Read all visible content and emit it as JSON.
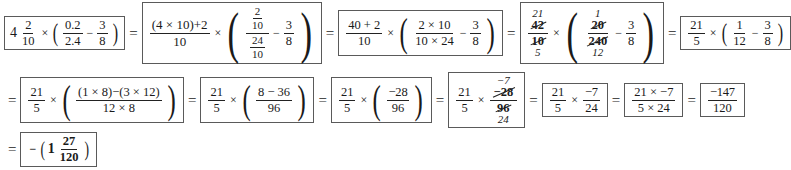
{
  "document": {
    "type": "math-worksheet-solution",
    "title": "Mixed number multiplication and subtraction of fractions, step-by-step",
    "equals_sign": "=",
    "times_sign": "×",
    "minus_sign": "−",
    "plus_sign": "+",
    "paren_open": "(",
    "paren_close": ")",
    "box_border_color": "#5a5a5a",
    "text_color": "#1a1a1a",
    "background_color": "#ffffff"
  },
  "rows": [
    {
      "id": "row-1",
      "steps": [
        {
          "id": "step-1",
          "label": "original-problem",
          "mixed_whole": "4",
          "mixed_num": "2",
          "mixed_den": "10",
          "times": "×",
          "f1_num": "0.2",
          "f1_den": "2.4",
          "minus": "−",
          "f2_num": "3",
          "f2_den": "8"
        },
        {
          "id": "step-2",
          "label": "convert-mixed-to-improper",
          "outer_num_a": "(4 × 10)",
          "outer_num_plus": "+",
          "outer_num_b": "2",
          "outer_den": "10",
          "times": "×",
          "complex_top_num": "2",
          "complex_top_den": "10",
          "complex_bot_num": "24",
          "complex_bot_den": "10",
          "minus": "−",
          "f2_num": "3",
          "f2_den": "8"
        },
        {
          "id": "step-3",
          "label": "multiply-out-and-invert",
          "outer_num": "40 + 2",
          "outer_den": "10",
          "times": "×",
          "inner_num": "2 × 10",
          "inner_den": "10 × 24",
          "minus": "−",
          "f2_num": "3",
          "f2_den": "8"
        },
        {
          "id": "step-4",
          "label": "cancel-common-factors",
          "left_num_repl": "21",
          "left_num_struck": "42",
          "left_den_struck": "10",
          "left_den_repl": "5",
          "times": "×",
          "inner_num_repl": "1",
          "inner_num_struck": "20",
          "inner_den_struck": "240",
          "inner_den_repl": "12",
          "minus": "−",
          "f2_num": "3",
          "f2_den": "8"
        },
        {
          "id": "step-5",
          "label": "reduced-fractions",
          "left_num": "21",
          "left_den": "5",
          "times": "×",
          "inner_num": "1",
          "inner_den": "12",
          "minus": "−",
          "f2_num": "3",
          "f2_den": "8"
        }
      ]
    },
    {
      "id": "row-2",
      "steps": [
        {
          "id": "step-6",
          "label": "common-denominator-expansion",
          "left_num": "21",
          "left_den": "5",
          "times": "×",
          "inner_num_a": "(1 × 8)",
          "inner_num_minus": "−",
          "inner_num_b": "(3 × 12)",
          "inner_den": "12 × 8"
        },
        {
          "id": "step-7",
          "label": "evaluate-products",
          "left_num": "21",
          "left_den": "5",
          "times": "×",
          "inner_num": "8 − 36",
          "inner_den": "96"
        },
        {
          "id": "step-8",
          "label": "evaluate-difference",
          "left_num": "21",
          "left_den": "5",
          "times": "×",
          "inner_num": "−28",
          "inner_den": "96"
        },
        {
          "id": "step-9",
          "label": "cancel-28-over-96",
          "left_num": "21",
          "left_den": "5",
          "times": "×",
          "inner_num_repl": "−7",
          "inner_num_struck": "−28",
          "inner_den_struck": "96",
          "inner_den_repl": "24"
        },
        {
          "id": "step-10",
          "label": "reduced-product",
          "left_num": "21",
          "left_den": "5",
          "times": "×",
          "right_num": "−7",
          "right_den": "24"
        },
        {
          "id": "step-11",
          "label": "multiply-numerators-denominators",
          "num": "21 × −7",
          "den": "5 × 24"
        },
        {
          "id": "step-12",
          "label": "improper-result",
          "num": "−147",
          "den": "120"
        }
      ]
    },
    {
      "id": "row-3",
      "steps": [
        {
          "id": "step-13",
          "label": "final-answer-mixed-number",
          "minus": "−",
          "whole": "1",
          "num": "27",
          "den": "120"
        }
      ]
    }
  ]
}
